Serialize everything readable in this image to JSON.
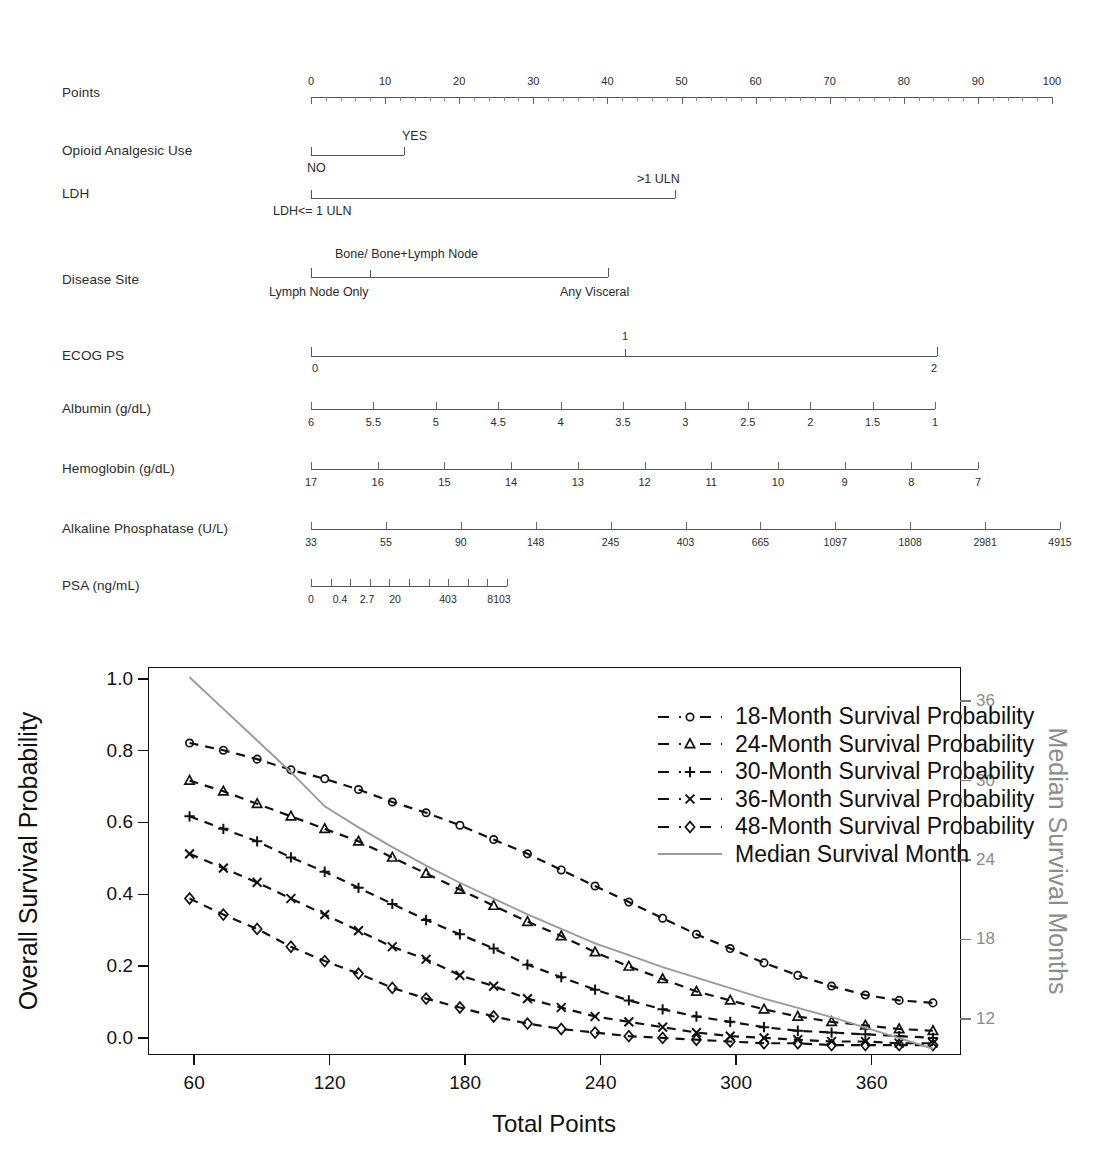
{
  "nomogram": {
    "rows": [
      {
        "name": "points",
        "label": "Points",
        "type": "scale",
        "ticks": [
          "0",
          "10",
          "20",
          "30",
          "40",
          "50",
          "60",
          "70",
          "80",
          "90",
          "100"
        ]
      },
      {
        "name": "opioid-analgesic-use",
        "label": "Opioid Analgesic Use",
        "type": "binary",
        "left_category": "NO",
        "right_category": "YES"
      },
      {
        "name": "ldh",
        "label": "LDH",
        "type": "binary",
        "left_category": "LDH<= 1 ULN",
        "right_category": ">1 ULN"
      },
      {
        "name": "disease-site",
        "label": "Disease Site",
        "type": "categorical",
        "left_category": "Lymph Node Only",
        "mid_category": "Bone/ Bone+Lymph Node",
        "right_category": "Any Visceral"
      },
      {
        "name": "ecog-ps",
        "label": "ECOG  PS",
        "type": "categorical",
        "left_category": "0",
        "mid_category": "1",
        "right_category": "2"
      },
      {
        "name": "albumin",
        "label": "Albumin  (g/dL)",
        "type": "scale",
        "ticks": [
          "6",
          "5.5",
          "5",
          "4.5",
          "4",
          "3.5",
          "3",
          "2.5",
          "2",
          "1.5",
          "1"
        ]
      },
      {
        "name": "hemoglobin",
        "label": "Hemoglobin  (g/dL)",
        "type": "scale",
        "ticks": [
          "17",
          "16",
          "15",
          "14",
          "13",
          "12",
          "11",
          "10",
          "9",
          "8",
          "7"
        ]
      },
      {
        "name": "alkaline-phosphatase",
        "label": "Alkaline Phosphatase  (U/L)",
        "type": "scale",
        "ticks": [
          "33",
          "55",
          "90",
          "148",
          "245",
          "403",
          "665",
          "1097",
          "1808",
          "2981",
          "4915"
        ]
      },
      {
        "name": "psa",
        "label": "PSA    (ng/mL)",
        "type": "scale",
        "ticks": [
          "0",
          "0.4",
          "2.7",
          "20",
          "403",
          "8103"
        ]
      }
    ]
  },
  "chart_data": {
    "type": "line",
    "title": "",
    "xlabel": "Total Points",
    "ylabel": "Overall Survival Probability",
    "y2label": "Median Survival Months",
    "xlim": [
      40,
      400
    ],
    "ylim": [
      -0.05,
      1.03
    ],
    "y2lim": [
      9.2,
      38.5
    ],
    "xticks": [
      60,
      120,
      180,
      240,
      300,
      360
    ],
    "yticks": [
      "0.0",
      "0.2",
      "0.4",
      "0.6",
      "0.8",
      "1.0"
    ],
    "y2ticks": [
      12,
      18,
      24,
      30,
      36
    ],
    "grid": false,
    "legend_position": "top-right",
    "x": [
      58,
      73,
      88,
      103,
      118,
      133,
      148,
      163,
      178,
      193,
      208,
      223,
      238,
      253,
      268,
      283,
      298,
      313,
      328,
      343,
      358,
      373,
      388
    ],
    "series": [
      {
        "name": "18-Month Survival Probability",
        "marker": "circle",
        "linestyle": "dashed",
        "axis": "left",
        "values": [
          0.82,
          0.8,
          0.775,
          0.745,
          0.72,
          0.69,
          0.655,
          0.625,
          0.59,
          0.55,
          0.51,
          0.465,
          0.42,
          0.375,
          0.33,
          0.285,
          0.245,
          0.205,
          0.17,
          0.14,
          0.115,
          0.1,
          0.093
        ]
      },
      {
        "name": "24-Month Survival Probability",
        "marker": "triangle",
        "linestyle": "dashed",
        "axis": "left",
        "values": [
          0.715,
          0.685,
          0.65,
          0.615,
          0.58,
          0.545,
          0.5,
          0.455,
          0.41,
          0.365,
          0.32,
          0.28,
          0.235,
          0.195,
          0.16,
          0.125,
          0.1,
          0.075,
          0.055,
          0.04,
          0.03,
          0.02,
          0.015
        ]
      },
      {
        "name": "30-Month Survival Probability",
        "marker": "plus",
        "linestyle": "dashed",
        "axis": "left",
        "values": [
          0.615,
          0.58,
          0.545,
          0.5,
          0.46,
          0.415,
          0.37,
          0.325,
          0.285,
          0.245,
          0.2,
          0.165,
          0.13,
          0.1,
          0.075,
          0.055,
          0.04,
          0.025,
          0.015,
          0.01,
          0.005,
          0.0,
          -0.005
        ]
      },
      {
        "name": "36-Month Survival Probability",
        "marker": "cross",
        "linestyle": "dashed",
        "axis": "left",
        "values": [
          0.51,
          0.47,
          0.43,
          0.385,
          0.34,
          0.295,
          0.25,
          0.215,
          0.17,
          0.14,
          0.105,
          0.08,
          0.055,
          0.04,
          0.025,
          0.01,
          0.0,
          -0.005,
          -0.01,
          -0.015,
          -0.015,
          -0.02,
          -0.02
        ]
      },
      {
        "name": "48-Month Survival Probability",
        "marker": "diamond",
        "linestyle": "dashed",
        "axis": "left",
        "values": [
          0.385,
          0.34,
          0.3,
          0.25,
          0.21,
          0.175,
          0.135,
          0.105,
          0.08,
          0.055,
          0.035,
          0.02,
          0.01,
          0.0,
          -0.005,
          -0.01,
          -0.015,
          -0.02,
          -0.02,
          -0.025,
          -0.025,
          -0.025,
          -0.025
        ]
      },
      {
        "name": "Median Survival Month",
        "marker": "none",
        "linestyle": "solid",
        "axis": "right",
        "color": "#9a9a9a",
        "x": [
          58,
          73,
          88,
          103,
          118,
          133,
          148,
          163,
          178,
          193,
          208,
          223,
          238,
          253,
          268,
          283,
          298,
          313,
          328,
          343,
          358,
          373,
          388
        ],
        "values": [
          37.8,
          35.4,
          33.0,
          30.6,
          28.0,
          26.4,
          24.9,
          23.5,
          22.2,
          21.0,
          19.8,
          18.7,
          17.6,
          16.7,
          15.8,
          15.0,
          14.2,
          13.4,
          12.7,
          12.0,
          11.2,
          10.4,
          9.6
        ]
      }
    ],
    "legend": [
      "18-Month Survival Probability",
      "24-Month Survival Probability",
      "30-Month Survival Probability",
      "36-Month Survival Probability",
      "48-Month Survival Probability",
      "Median Survival Month"
    ]
  }
}
